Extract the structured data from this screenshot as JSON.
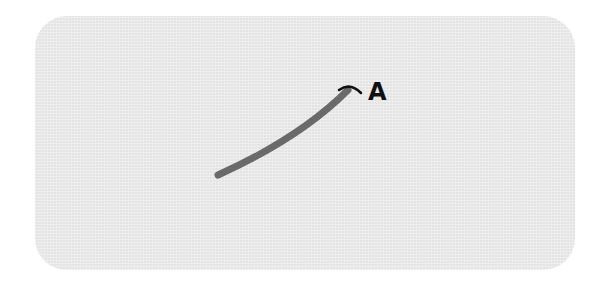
{
  "diagram": {
    "label": "A",
    "colors": {
      "panel": "#e4e4e4",
      "stroke": "#6a6a6a",
      "arc": "#111111",
      "label": "#111111"
    }
  }
}
